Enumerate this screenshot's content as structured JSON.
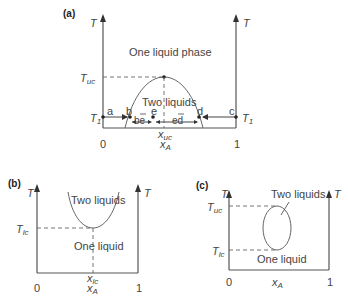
{
  "figure": {
    "panels": [
      {
        "id": "a",
        "label": "(a)",
        "left_axis_label": "T",
        "right_axis_label": "T",
        "region_upper": "One liquid phase",
        "region_inside": "Two liquids",
        "critical_temp_label": "T",
        "critical_temp_sub": "uc",
        "t1_label_left": "T",
        "t1_label_right": "T",
        "t1_sub": "1",
        "points": [
          "a",
          "b",
          "e",
          "d",
          "c"
        ],
        "segment_be": "be",
        "segment_ed": "ed",
        "critical_x_label": "x",
        "critical_x_sub": "uc",
        "x_axis_label": "x",
        "x_axis_sub": "A",
        "x_tick_left": "0",
        "x_tick_right": "1"
      },
      {
        "id": "b",
        "label": "(b)",
        "left_axis_label": "T",
        "right_axis_label": "T",
        "region_upper": "Two liquids",
        "region_lower": "One liquid",
        "critical_temp_label": "T",
        "critical_temp_sub": "lc",
        "critical_x_label": "x",
        "critical_x_sub": "lc",
        "x_axis_label": "x",
        "x_axis_sub": "A",
        "x_tick_left": "0",
        "x_tick_right": "1"
      },
      {
        "id": "c",
        "label": "(c)",
        "left_axis_label": "T",
        "right_axis_label": "T",
        "region_inside": "Two liquids",
        "region_lower": "One liquid",
        "upper_temp_label": "T",
        "upper_temp_sub": "uc",
        "lower_temp_label": "T",
        "lower_temp_sub": "lc",
        "x_axis_label": "x",
        "x_axis_sub": "A",
        "x_tick_left": "0",
        "x_tick_right": "1"
      }
    ]
  }
}
